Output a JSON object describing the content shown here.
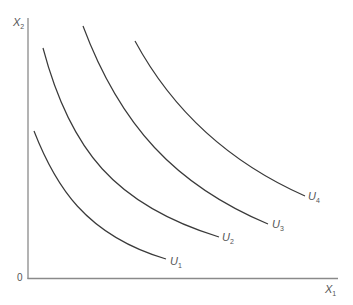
{
  "diagram": {
    "type": "indifference-curves",
    "axes": {
      "y_label": {
        "base": "X",
        "sub": "2"
      },
      "x_label": {
        "base": "X",
        "sub": "1"
      },
      "origin": "0"
    },
    "curves": [
      {
        "name": "U1",
        "label_base": "U",
        "label_sub": "1"
      },
      {
        "name": "U2",
        "label_base": "U",
        "label_sub": "2"
      },
      {
        "name": "U3",
        "label_base": "U",
        "label_sub": "3"
      },
      {
        "name": "U4",
        "label_base": "U",
        "label_sub": "4"
      }
    ]
  }
}
